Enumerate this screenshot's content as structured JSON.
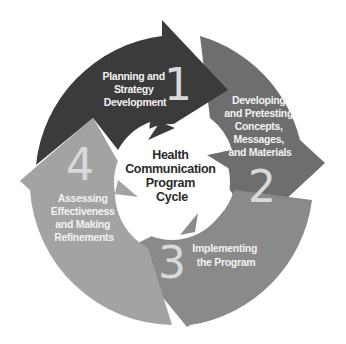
{
  "diagram": {
    "type": "cycle",
    "center_title": [
      "Health",
      "Communication",
      "Program",
      "Cycle"
    ],
    "colors": {
      "segment_1": "#3b3b3b",
      "segment_2": "#6e6e6e",
      "segment_3": "#8a8a8a",
      "segment_4": "#a3a3a3",
      "label_text": "#f2f2f2",
      "number_text": "#d9d9d9",
      "center_text": "#2a2a2a"
    },
    "segments": [
      {
        "number": "1",
        "label": [
          "Planning and",
          "Strategy",
          "Development"
        ]
      },
      {
        "number": "2",
        "label": [
          "Developing",
          "and Pretesting",
          "Concepts,",
          "Messages,",
          "and Materials"
        ]
      },
      {
        "number": "3",
        "label": [
          "Implementing",
          "the Program"
        ]
      },
      {
        "number": "4",
        "label": [
          "Assessing",
          "Effectiveness",
          "and Making",
          "Refinements"
        ]
      }
    ]
  }
}
